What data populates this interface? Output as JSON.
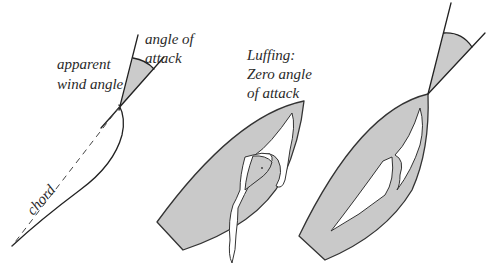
{
  "figure": {
    "colors": {
      "fill_grey": "#c9c9c9",
      "line": "#222222",
      "background": "#ffffff"
    },
    "panel_left": {
      "label_apparent_wind_line1": "apparent",
      "label_apparent_wind_line2": "wind angle",
      "label_angle_attack_line1": "angle of",
      "label_angle_attack_line2": "attack",
      "label_chord": "chord"
    },
    "panel_middle": {
      "label_line1": "Luffing:",
      "label_line2": "Zero angle",
      "label_line3": "of attack"
    },
    "panel_right": {}
  }
}
